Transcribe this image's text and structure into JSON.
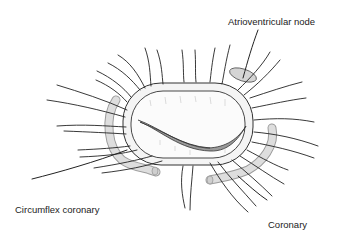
{
  "diagram": {
    "labels": {
      "atrioventricular_node": "Atrioventricular node",
      "circumflex_line1": "Circumflex coronary",
      "circumflex_line2": "artery",
      "coronary_sinus_line1": "Coronary",
      "coronary_sinus_line2": "sinus"
    },
    "colors": {
      "background": "#ffffff",
      "ink": "#222222",
      "vessel_fill": "#dcdcdc",
      "leaflet_shadow": "#9a9a9a"
    }
  }
}
